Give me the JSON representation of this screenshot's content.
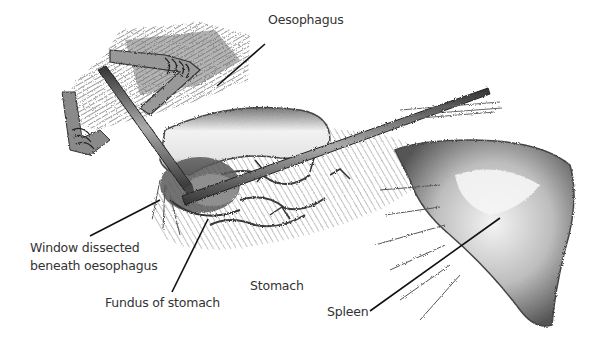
{
  "figure": {
    "type": "surgical-illustration",
    "style": "pencil-sketch-grayscale",
    "labels": [
      {
        "id": "oesophagus",
        "text": "Oesophagus",
        "x": 268,
        "y": 20,
        "pointer": {
          "x1": 265,
          "y1": 44,
          "x2": 217,
          "y2": 86
        }
      },
      {
        "id": "window",
        "line1": "Window dissected",
        "line2": "beneath oesophagus",
        "x": 30,
        "y": 241,
        "pointer": {
          "x1": 90,
          "y1": 236,
          "x2": 160,
          "y2": 200
        }
      },
      {
        "id": "fundus",
        "text": "Fundus of stomach",
        "x": 105,
        "y": 297,
        "pointer": {
          "x1": 172,
          "y1": 292,
          "x2": 208,
          "y2": 219
        }
      },
      {
        "id": "stomach",
        "text": "Stomach",
        "x": 250,
        "y": 278
      },
      {
        "id": "spleen",
        "text": "Spleen",
        "x": 327,
        "y": 308,
        "pointer": {
          "x1": 370,
          "y1": 311,
          "x2": 500,
          "y2": 218
        }
      }
    ],
    "colors": {
      "background": "#ffffff",
      "ink": "#2a2a2a",
      "shade_dark": "#555555",
      "shade_mid": "#8a8a8a",
      "shade_light": "#c8c8c8",
      "label_text": "#333333"
    }
  }
}
